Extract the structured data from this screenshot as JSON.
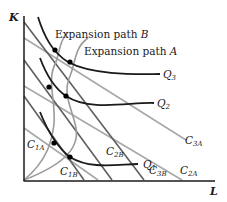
{
  "diagram": {
    "type": "isoquant-isocost expansion paths",
    "axes": {
      "y_label": "K",
      "x_label": "L"
    },
    "isoquants": [
      {
        "label": "Q",
        "sub": "1"
      },
      {
        "label": "Q",
        "sub": "2"
      },
      {
        "label": "Q",
        "sub": "3"
      }
    ],
    "isocost_lines_A": [
      {
        "label": "C",
        "sub": "1A"
      },
      {
        "label": "C",
        "sub": "2A"
      },
      {
        "label": "C",
        "sub": "3A"
      }
    ],
    "isocost_lines_B": [
      {
        "label": "C",
        "sub": "1B"
      },
      {
        "label": "C",
        "sub": "2B"
      },
      {
        "label": "C",
        "sub": "3B"
      }
    ],
    "expansion_paths": [
      {
        "label_text": "Expansion path ",
        "label_letter": "B"
      },
      {
        "label_text": "Expansion path ",
        "label_letter": "A"
      }
    ],
    "colors": {
      "axis": "#1a1a1a",
      "isoquant": "#1a1a1a",
      "isocost_A": "#a8a8a8",
      "isocost_B": "#5a5a5a",
      "expansion_path": "#9a9a9a",
      "tangency_point": "#000000"
    }
  }
}
